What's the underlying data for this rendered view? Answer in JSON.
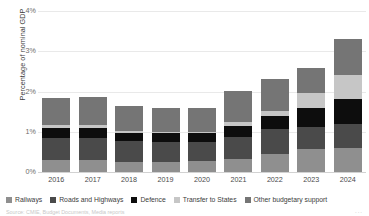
{
  "chart_data": {
    "type": "bar",
    "stacked": true,
    "title": "",
    "xlabel": "",
    "ylabel": "Percentage of nominal GDP",
    "categories": [
      "2016",
      "2017",
      "2018",
      "2019",
      "2020",
      "2021",
      "2022",
      "2023",
      "2024"
    ],
    "ylim": [
      0,
      4
    ],
    "yticks": [
      "0%",
      "1%",
      "2%",
      "3%",
      "4%"
    ],
    "ytick_values": [
      0,
      1,
      2,
      3,
      4
    ],
    "grid": true,
    "legend_position": "bottom",
    "series": [
      {
        "name": "Railways",
        "color": "#8f8f8f",
        "values": [
          0.3,
          0.29,
          0.26,
          0.26,
          0.27,
          0.33,
          0.45,
          0.57,
          0.6
        ]
      },
      {
        "name": "Roads and Highways",
        "color": "#4a4a4a",
        "values": [
          0.55,
          0.55,
          0.5,
          0.48,
          0.48,
          0.55,
          0.62,
          0.55,
          0.6
        ]
      },
      {
        "name": "Defence",
        "color": "#0d0d0d",
        "values": [
          0.25,
          0.26,
          0.22,
          0.22,
          0.22,
          0.27,
          0.32,
          0.47,
          0.62
        ]
      },
      {
        "name": "Transfer to States",
        "color": "#c6c6c6",
        "values": [
          0.07,
          0.08,
          0.03,
          0.03,
          0.03,
          0.1,
          0.13,
          0.37,
          0.6
        ]
      },
      {
        "name": "Other budgetary support",
        "color": "#757575",
        "values": [
          0.68,
          0.68,
          0.62,
          0.6,
          0.58,
          0.77,
          0.78,
          0.63,
          0.88
        ]
      }
    ]
  },
  "footer": {
    "source_text": "Source: CMIE, Budget Documents, Media reports",
    "corner_mark": "..."
  }
}
